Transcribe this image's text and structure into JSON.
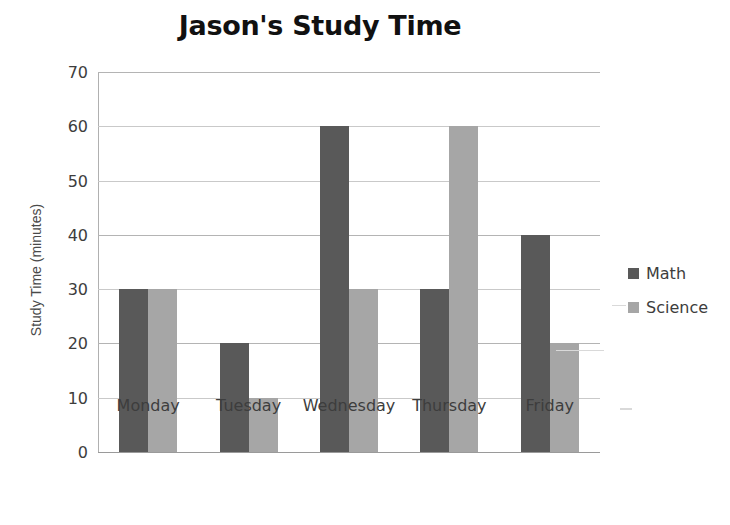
{
  "chart_data": {
    "type": "bar",
    "title": "Jason's Study Time",
    "xlabel": "",
    "ylabel": "Study Time (minutes)",
    "categories": [
      "Monday",
      "Tuesday",
      "Wednesday",
      "Thursday",
      "Friday"
    ],
    "series": [
      {
        "name": "Math",
        "color": "#595959",
        "values": [
          30,
          20,
          60,
          30,
          40
        ]
      },
      {
        "name": "Science",
        "color": "#a6a6a6",
        "values": [
          30,
          10,
          30,
          60,
          20
        ]
      }
    ],
    "ylim": [
      0,
      70
    ],
    "ytick_step": 10,
    "ytick_labels": [
      "0",
      "10",
      "20",
      "30",
      "40",
      "50",
      "60",
      "70"
    ],
    "grid": true,
    "grid_axis": "y",
    "legend_position": "right"
  }
}
